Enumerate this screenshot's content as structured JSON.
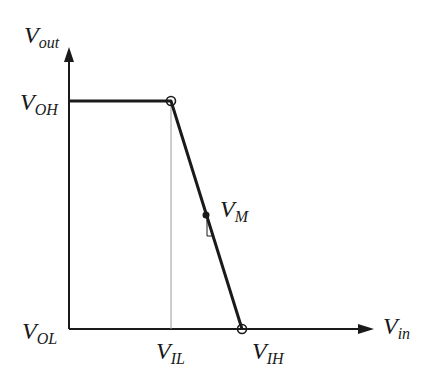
{
  "diagram": {
    "axes": {
      "y_label": {
        "main": "V",
        "sub": "out"
      },
      "x_label": {
        "main": "V",
        "sub": "in"
      }
    },
    "y_ticks": [
      {
        "main": "V",
        "sub": "OH"
      },
      {
        "main": "V",
        "sub": "OL"
      }
    ],
    "x_ticks": [
      {
        "main": "V",
        "sub": "IL"
      },
      {
        "main": "V",
        "sub": "IH"
      }
    ],
    "points": {
      "midpoint": {
        "main": "V",
        "sub": "M"
      }
    },
    "colors": {
      "line": "#1a1a1a",
      "guide": "#9a9a9a",
      "background": "#ffffff"
    }
  }
}
